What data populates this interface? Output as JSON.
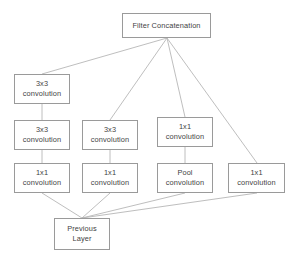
{
  "diagram": {
    "colors": {
      "background": "#ffffff",
      "node_border": "#9a9a9a",
      "node_fill": "#ffffff",
      "text": "#3f3f3f",
      "edge": "#b7b7b7"
    },
    "nodes": [
      {
        "id": "filter-concatenation",
        "line1": "Filter Concatenation",
        "line2": "",
        "x": 122,
        "y": 13,
        "w": 89,
        "h": 25
      },
      {
        "id": "conv3x3-top-left",
        "line1": "3x3",
        "line2": "convolution",
        "x": 14,
        "y": 74,
        "w": 56,
        "h": 30
      },
      {
        "id": "conv3x3-mid-left",
        "line1": "3x3",
        "line2": "convolution",
        "x": 14,
        "y": 120,
        "w": 56,
        "h": 30
      },
      {
        "id": "conv3x3-mid-center",
        "line1": "3x3",
        "line2": "convolution",
        "x": 82,
        "y": 120,
        "w": 56,
        "h": 30
      },
      {
        "id": "conv1x1-mid-right",
        "line1": "1x1",
        "line2": "convolution",
        "x": 157,
        "y": 117,
        "w": 56,
        "h": 30
      },
      {
        "id": "conv1x1-bottom-left",
        "line1": "1x1",
        "line2": "convolution",
        "x": 14,
        "y": 163,
        "w": 56,
        "h": 30
      },
      {
        "id": "conv1x1-bottom-center",
        "line1": "1x1",
        "line2": "convolution",
        "x": 82,
        "y": 163,
        "w": 56,
        "h": 30
      },
      {
        "id": "pool-convolution",
        "line1": "Pool",
        "line2": "convolution",
        "x": 157,
        "y": 163,
        "w": 56,
        "h": 30
      },
      {
        "id": "conv1x1-far-right",
        "line1": "1x1",
        "line2": "convolution",
        "x": 228,
        "y": 163,
        "w": 57,
        "h": 30
      },
      {
        "id": "previous-layer",
        "line1": "Previous",
        "line2": "Layer",
        "x": 54,
        "y": 218,
        "w": 56,
        "h": 32
      }
    ],
    "edges": [
      {
        "id": "edge-conv3x3-top-left-to-filter",
        "x1": 42,
        "y1": 74,
        "x2": 167,
        "y2": 38
      },
      {
        "id": "edge-conv3x3-mid-center-to-filter",
        "x1": 110,
        "y1": 120,
        "x2": 167,
        "y2": 38
      },
      {
        "id": "edge-conv1x1-mid-right-to-filter",
        "x1": 185,
        "y1": 117,
        "x2": 167,
        "y2": 38
      },
      {
        "id": "edge-conv1x1-far-right-to-filter",
        "x1": 257,
        "y1": 163,
        "x2": 167,
        "y2": 38
      },
      {
        "id": "edge-conv3x3-mid-left-to-conv3x3-top-left",
        "x1": 42,
        "y1": 120,
        "x2": 42,
        "y2": 104
      },
      {
        "id": "edge-conv1x1-bottom-left-to-conv3x3-mid-left",
        "x1": 42,
        "y1": 163,
        "x2": 42,
        "y2": 150
      },
      {
        "id": "edge-conv1x1-bottom-center-to-conv3x3-mid-center",
        "x1": 110,
        "y1": 163,
        "x2": 110,
        "y2": 150
      },
      {
        "id": "edge-pool-to-conv1x1-mid-right",
        "x1": 185,
        "y1": 163,
        "x2": 185,
        "y2": 147
      },
      {
        "id": "edge-previous-to-conv1x1-bottom-left",
        "x1": 82,
        "y1": 218,
        "x2": 42,
        "y2": 193
      },
      {
        "id": "edge-previous-to-conv1x1-bottom-center",
        "x1": 82,
        "y1": 218,
        "x2": 110,
        "y2": 193
      },
      {
        "id": "edge-previous-to-pool",
        "x1": 82,
        "y1": 218,
        "x2": 185,
        "y2": 193
      },
      {
        "id": "edge-previous-to-conv1x1-far-right",
        "x1": 82,
        "y1": 218,
        "x2": 257,
        "y2": 193
      }
    ]
  }
}
